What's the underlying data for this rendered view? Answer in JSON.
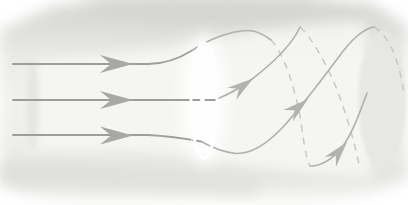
{
  "meta": {
    "width": 408,
    "height": 205,
    "visible_text": "none"
  },
  "colors": {
    "page_background": "#ffffff",
    "ambient_top_shade": "#d2d2d0",
    "ambient_mid_shade": "#f1f1ef",
    "ambient_bottom_shade": "#dbdbd9",
    "stream_tube_highlight": "#f7f7f5",
    "inlet_disk": "#dadad8",
    "wake_end_disk": "#e7e7e5",
    "rotor": "#ffffff",
    "streamline_upstream": "#9d9d9b",
    "streamline_wake_solid": "#b0b0ae",
    "streamline_wake_hidden": "#c8c8c6",
    "arrow_upstream": "#a8a8a6",
    "arrow_wake": "#b2b2b0"
  },
  "arrow": {
    "points_large": "0,0 -33,-9 -22,0 -33,9",
    "points_small": "0,0 -26,-7.5 -17.5,0 -26,7.5"
  },
  "paths": {
    "bg_blob": "M 0,30 L 55,6 L 120,0 L 330,0 L 372,4 L 408,26 L 408,180 L 360,196 L 300,202 L 80,202 L 30,196 L 0,182 Z",
    "bottom_band": "M 0,162 C 80,164 180,170 265,180 L 255,196 C 150,192 60,190 0,188 Z",
    "tube_highlight": "M 30,62 C 100,56 160,50 200,42 C 260,30 320,24 365,22 L 372,178 C 320,176 260,170 205,158 C 150,146 80,150 30,148 Z",
    "streamline_top": "M 13,64 L 148,64 C 166,64 180,58 192,50.5",
    "streamline_middle": "M 13,100 L 216,100",
    "streamline_bottom": "M 13,135 L 148,135 C 168,136 185,138.5 201,141.5",
    "helix1_crest": "M 192,50.5 C 208,40 230,30.5 248,30.5 C 256,30.5 263,34 271,40",
    "helix1_hidden": "M 271,40 C 284,53 294,86 300,116 C 303,134 305,157 310,166",
    "helix1_rise": "M 310,166 C 322,166 333,159 343,146 C 353,132 360,112 367,93",
    "helix2_rise": "M 216,99.5 C 229,94 240,88 249,81.5 C 272,64 292,45 300,27",
    "helix2_hidden": "M 300,27 C 309,35 321,54 332,78 C 343,102 354,140 359,164",
    "helix3_rise": "M 201,141.5 C 213,148 225,152.5 236,153.5 C 252,154 268,143 283,127 C 298,111 320,82 338,58 C 348,44 362,29 374,27",
    "helix3_hidden": "M 374,27 C 383,32 391,44 396,59 C 400,71 403,84 404,95",
    "blade_up": "M 203,99 Q 199.5,74 202.5,49 Q 206.5,74 203,99 Z",
    "blade_lower_left": "M 202,101 Q 193,121 191,144 Q 199,124 202,101 Z",
    "blade_lower_right": "M 203,101 Q 211,122 213,146 Q 205,124 203,101 Z"
  }
}
